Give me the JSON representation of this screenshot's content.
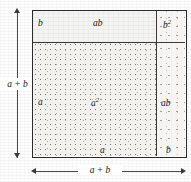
{
  "figure": {
    "identity": "(a + b)^2 = a^2 + 2ab + b^2",
    "outer_side_label": "a + b",
    "vertical_dimension_label": "a + b",
    "horizontal_dimension_label": "a + b"
  },
  "regions": [
    {
      "id": "top-left-strip",
      "area_label": "ab",
      "edge_label_left": "b",
      "fill": "light",
      "position": "top-left"
    },
    {
      "id": "top-right-corner",
      "area_label": "b",
      "area_label_exponent": "2",
      "fill": "sparse",
      "position": "top-right"
    },
    {
      "id": "large-square",
      "area_label": "a",
      "area_label_exponent": "2",
      "edge_label_left": "a",
      "edge_label_bottom": "a",
      "fill": "stipple",
      "position": "bottom-left"
    },
    {
      "id": "right-strip",
      "area_label": "ab",
      "edge_label_bottom": "b",
      "fill": "sparse",
      "position": "bottom-right"
    }
  ],
  "labels": {
    "b_top_left": "b",
    "ab_top": "ab",
    "b_squared_base": "b",
    "b_squared_exp": "2",
    "a_left": "a",
    "a_squared_base": "a",
    "a_squared_exp": "2",
    "ab_right": "ab",
    "a_bottom": "a",
    "b_bottom": "b",
    "dim_vertical": "a + b",
    "dim_horizontal": "a + b"
  },
  "colors": {
    "ink": "#1a1a1a",
    "frame": "#2b2b2b",
    "divider": "#3a3a3a",
    "paper": "#fefefe",
    "light_fill": "#f4f4f2",
    "stipple_fill": "#f2f1ee",
    "sparse_fill": "#f6f5f3"
  }
}
